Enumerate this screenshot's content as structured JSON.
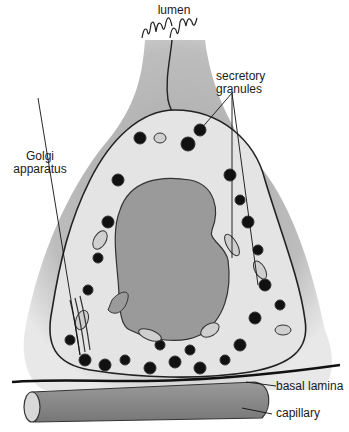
{
  "diagram": {
    "type": "cell-illustration",
    "labels": {
      "lumen": "lumen",
      "secretory_granules_1": "secretory",
      "secretory_granules_2": "granules",
      "golgi_1": "Golgi",
      "golgi_2": "apparatus",
      "basal_lamina": "basal lamina",
      "capillary": "capillary"
    },
    "colors": {
      "background": "#ffffff",
      "cell_body": "#b5b5b5",
      "cytoplasm": "#e6e6e6",
      "nucleus": "#9a9a9a",
      "granule": "#111111",
      "capillary": "#8a8a8a",
      "outline": "#222222"
    }
  }
}
